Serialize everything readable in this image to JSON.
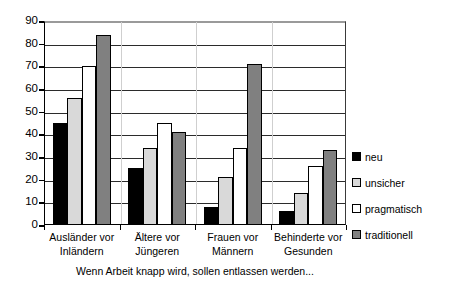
{
  "chart_data": {
    "type": "bar",
    "title": "",
    "subtitle": "",
    "caption": "Wenn Arbeit knapp wird, sollen entlassen werden...",
    "xlabel": "",
    "ylabel": "",
    "ylim": [
      0,
      90
    ],
    "ytick_step": 10,
    "yticks": [
      "0",
      "10",
      "20",
      "30",
      "40",
      "50",
      "60",
      "70",
      "80",
      "90"
    ],
    "grid": "horizontal",
    "legend_position": "right",
    "categories": [
      "Ausländer vor Inländern",
      "Ältere vor Jüngeren",
      "Frauen vor Männern",
      "Behinderte vor Gesunden"
    ],
    "category_lines": [
      [
        "Ausländer vor",
        "Inländern"
      ],
      [
        "Ältere vor",
        "Jüngeren"
      ],
      [
        "Frauen vor",
        "Männern"
      ],
      [
        "Behinderte vor",
        "Gesunden"
      ]
    ],
    "series": [
      {
        "name": "neu",
        "color": "#000000",
        "values": [
          45,
          25,
          8,
          6
        ]
      },
      {
        "name": "unsicher",
        "color": "#d9d9d9",
        "values": [
          56,
          34,
          21,
          14
        ]
      },
      {
        "name": "pragmatisch",
        "color": "#ffffff",
        "values": [
          70,
          45,
          34,
          26
        ]
      },
      {
        "name": "traditionell",
        "color": "#808080",
        "values": [
          84,
          41,
          71,
          33
        ]
      }
    ]
  },
  "legend": {
    "items": [
      {
        "label": "neu",
        "color": "#000000"
      },
      {
        "label": "unsicher",
        "color": "#d9d9d9"
      },
      {
        "label": "pragmatisch",
        "color": "#ffffff"
      },
      {
        "label": "traditionell",
        "color": "#808080"
      }
    ]
  },
  "colors": {
    "axis": "#000000",
    "gridline": "#2b2b2b",
    "gridline_top": "#9a9a9a",
    "group_separator": "#cfcfcf",
    "background": "#ffffff"
  }
}
